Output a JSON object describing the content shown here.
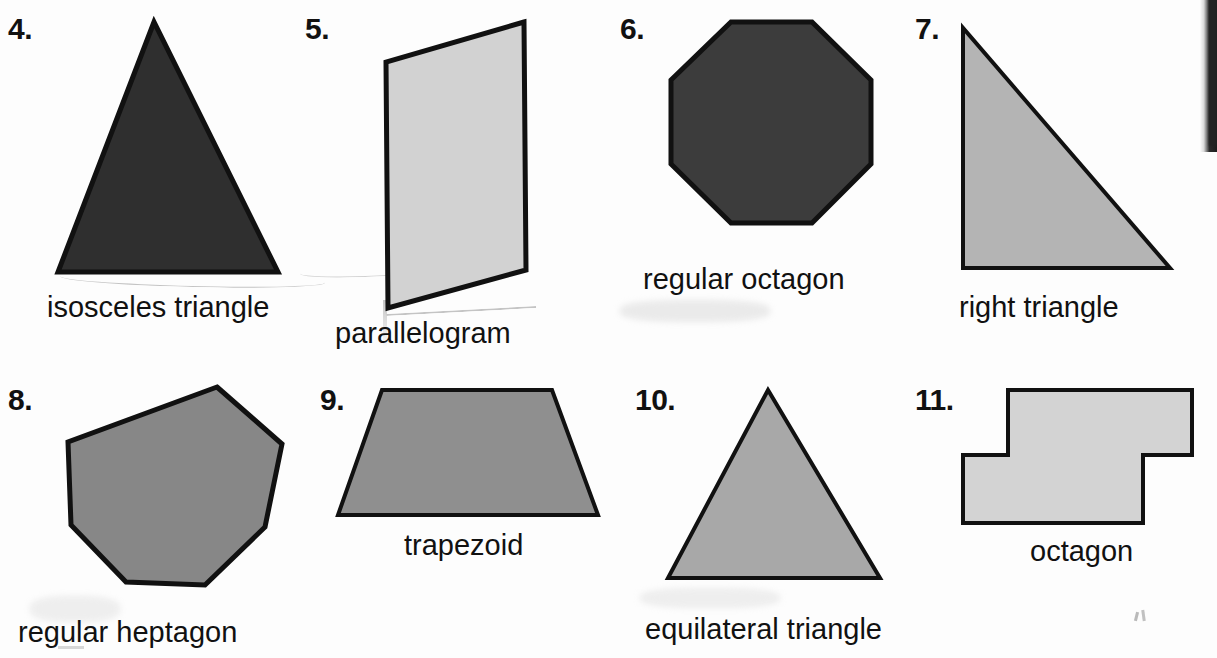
{
  "page": {
    "kind": "geometry-worksheet-scan",
    "background_color": "#fdfdfd",
    "outline_color": "#111111"
  },
  "items": [
    {
      "number": "4.",
      "label": "isosceles triangle",
      "shape": "isosceles-triangle",
      "fill": "#2f2f2f",
      "num_x": 8,
      "num_y": 14,
      "label_x": 47,
      "label_y": 293,
      "svg_x": 50,
      "svg_y": 14,
      "svg_w": 235,
      "svg_h": 262,
      "points": "104,8 8,258 228,258",
      "stroke_width": 5
    },
    {
      "number": "5.",
      "label": "parallelogram",
      "shape": "parallelogram",
      "fill": "#d2d2d2",
      "num_x": 305,
      "num_y": 14,
      "label_x": 335,
      "label_y": 319,
      "svg_x": 380,
      "svg_y": 16,
      "svg_w": 155,
      "svg_h": 300,
      "points": "144,6 6,46 8,292 146,254",
      "stroke_width": 5
    },
    {
      "number": "6.",
      "label": "regular octagon",
      "shape": "regular-octagon",
      "fill": "#3c3c3c",
      "num_x": 620,
      "num_y": 14,
      "label_x": 643,
      "label_y": 265,
      "svg_x": 660,
      "svg_y": 16,
      "svg_w": 225,
      "svg_h": 245,
      "points": "71,6 152,6 211,64 211,148 152,207 71,207 11,148 11,64",
      "stroke_width": 5
    },
    {
      "number": "7.",
      "label": "right triangle",
      "shape": "right-triangle",
      "fill": "#b4b4b4",
      "num_x": 915,
      "num_y": 14,
      "label_x": 959,
      "label_y": 293,
      "svg_x": 955,
      "svg_y": 20,
      "svg_w": 235,
      "svg_h": 260,
      "points": "8,8 8,248 215,248",
      "stroke_width": 4
    },
    {
      "number": "8.",
      "label": "regular heptagon",
      "shape": "regular-heptagon",
      "fill": "#878787",
      "num_x": 8,
      "num_y": 385,
      "label_x": 18,
      "label_y": 618,
      "svg_x": 50,
      "svg_y": 375,
      "svg_w": 240,
      "svg_h": 240,
      "points": "167,12 232,69 215,152 155,210 76,207 21,150 18,67",
      "stroke_width": 5
    },
    {
      "number": "9.",
      "label": "trapezoid",
      "shape": "trapezoid",
      "fill": "#8f8f8f",
      "num_x": 320,
      "num_y": 385,
      "label_x": 404,
      "label_y": 531,
      "svg_x": 330,
      "svg_y": 378,
      "svg_w": 280,
      "svg_h": 160,
      "points": "52,12 222,12 268,137 8,137",
      "stroke_width": 4
    },
    {
      "number": "10.",
      "label": "equilateral triangle",
      "shape": "equilateral-triangle",
      "fill": "#a8a8a8",
      "num_x": 635,
      "num_y": 385,
      "label_x": 645,
      "label_y": 615,
      "svg_x": 660,
      "svg_y": 378,
      "svg_w": 230,
      "svg_h": 240,
      "points": "108,12 220,200 8,200",
      "stroke_width": 4
    },
    {
      "number": "11.",
      "label": "octagon",
      "shape": "irregular-octagon",
      "fill": "#d3d3d3",
      "num_x": 915,
      "num_y": 385,
      "label_x": 1030,
      "label_y": 537,
      "svg_x": 955,
      "svg_y": 378,
      "svg_w": 250,
      "svg_h": 165,
      "points": "53,12 237,12 237,77 188,77 188,145 8,145 8,77 53,77",
      "stroke_width": 4
    }
  ]
}
